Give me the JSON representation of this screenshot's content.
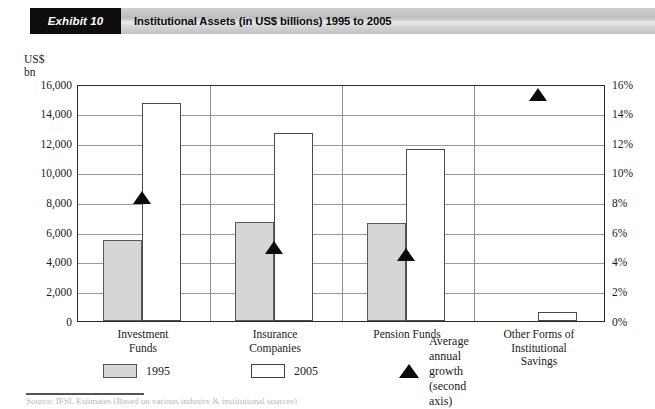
{
  "header": {
    "exhibit_tag": "Exhibit 10",
    "title": "Institutional Assets (in US$ billions) 1995 to 2005"
  },
  "axis_unit_caption": [
    "US$",
    "bn"
  ],
  "footer": {
    "source_note": "Source: IFSL Estimates (Based on various industry & institutional sources)"
  },
  "legend": {
    "entries": [
      {
        "label": "1995",
        "icon": "square-swatch-grey",
        "color": "#d6d6d6"
      },
      {
        "label": "2005",
        "icon": "square-swatch-white",
        "color": "#ffffff"
      },
      {
        "label": "Average annual growth (second axis)",
        "icon": "triangle-marker",
        "color": "#0a0a0a"
      }
    ]
  },
  "chart_data": {
    "type": "bar",
    "title": "Institutional Assets (in US$ billions) 1995 to 2005",
    "xlabel": "",
    "ylabel": "US$ bn",
    "y2label": "",
    "ylim": [
      0,
      16000
    ],
    "y2lim": [
      0,
      16
    ],
    "yticks": [
      "0",
      "2,000",
      "4,000",
      "6,000",
      "8,000",
      "10,000",
      "12,000",
      "14,000",
      "16,000"
    ],
    "y2ticks": [
      "0%",
      "2%",
      "4%",
      "6%",
      "8%",
      "10%",
      "12%",
      "14%",
      "16%"
    ],
    "grid": true,
    "legend_position": "bottom",
    "categories": [
      "Investment\nFunds",
      "Insurance\nCompanies",
      "Pension Funds",
      "Other Forms of\nInstitutional\nSavings"
    ],
    "series": [
      {
        "name": "1995",
        "axis": "left",
        "values": [
          5500,
          6700,
          6600,
          null
        ]
      },
      {
        "name": "2005",
        "axis": "left",
        "values": [
          14700,
          12700,
          11600,
          600
        ]
      },
      {
        "name": "Average annual growth (second axis)",
        "axis": "right",
        "type": "scatter",
        "values": [
          8.5,
          5.1,
          4.6,
          15.4
        ]
      }
    ]
  }
}
